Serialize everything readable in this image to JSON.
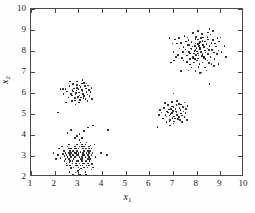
{
  "chart_data": {
    "type": "scatter",
    "title": "",
    "xlabel": "x1",
    "ylabel": "x2",
    "xlabel_base": "x",
    "xlabel_sub": "1",
    "ylabel_base": "x",
    "ylabel_sub": "2",
    "xlim": [
      1,
      10
    ],
    "ylim": [
      2,
      10
    ],
    "xticks": [
      1,
      2,
      3,
      4,
      5,
      6,
      7,
      8,
      9,
      10
    ],
    "yticks": [
      2,
      3,
      4,
      5,
      6,
      7,
      8,
      9,
      10
    ],
    "grid": false,
    "legend": null,
    "marker": "dot",
    "marker_color": "#0d0d0d",
    "marker_size": 1.6,
    "background": "#ffffff",
    "frame_color": "#4a4a4a",
    "clusters": [
      {
        "name": "cluster-lower-left",
        "center": [
          3.0,
          3.0
        ],
        "n": 120,
        "spread": [
          0.42,
          0.45
        ]
      },
      {
        "name": "cluster-mid-left",
        "center": [
          3.05,
          6.0
        ],
        "n": 55,
        "spread": [
          0.26,
          0.26
        ]
      },
      {
        "name": "cluster-center",
        "center": [
          7.05,
          5.0
        ],
        "n": 60,
        "spread": [
          0.3,
          0.27
        ]
      },
      {
        "name": "cluster-upper-right",
        "center": [
          8.05,
          7.95
        ],
        "n": 150,
        "spread": [
          0.45,
          0.42
        ]
      }
    ],
    "points": [
      [
        2.95,
        3.05
      ],
      [
        3.15,
        2.85
      ],
      [
        2.75,
        3.25
      ],
      [
        3.35,
        3.15
      ],
      [
        2.55,
        2.95
      ],
      [
        3.05,
        2.65
      ],
      [
        3.25,
        3.45
      ],
      [
        2.85,
        3.35
      ],
      [
        3.45,
        2.95
      ],
      [
        2.65,
        2.75
      ],
      [
        3.1,
        3.2
      ],
      [
        2.9,
        2.55
      ],
      [
        3.3,
        2.75
      ],
      [
        2.7,
        3.15
      ],
      [
        3.2,
        3.35
      ],
      [
        3.0,
        2.45
      ],
      [
        2.6,
        3.35
      ],
      [
        3.4,
        3.25
      ],
      [
        2.8,
        2.85
      ],
      [
        3.15,
        2.95
      ],
      [
        2.95,
        3.55
      ],
      [
        3.35,
        2.55
      ],
      [
        2.5,
        3.05
      ],
      [
        3.05,
        3.75
      ],
      [
        2.75,
        2.65
      ],
      [
        3.25,
        3.05
      ],
      [
        2.85,
        3.45
      ],
      [
        3.45,
        3.45
      ],
      [
        2.65,
        3.25
      ],
      [
        3.1,
        2.55
      ],
      [
        3.55,
        3.05
      ],
      [
        2.45,
        2.85
      ],
      [
        3.0,
        3.35
      ],
      [
        3.2,
        2.65
      ],
      [
        2.9,
        3.15
      ],
      [
        3.3,
        3.55
      ],
      [
        2.7,
        2.95
      ],
      [
        3.4,
        2.85
      ],
      [
        2.6,
        3.15
      ],
      [
        3.05,
        2.95
      ],
      [
        2.8,
        3.25
      ],
      [
        3.15,
        3.45
      ],
      [
        2.95,
        2.75
      ],
      [
        3.35,
        3.35
      ],
      [
        2.55,
        3.45
      ],
      [
        3.25,
        2.45
      ],
      [
        3.5,
        3.25
      ],
      [
        2.4,
        3.25
      ],
      [
        3.0,
        3.05
      ],
      [
        2.85,
        2.95
      ],
      [
        3.2,
        3.15
      ],
      [
        3.1,
        3.65
      ],
      [
        2.65,
        2.55
      ],
      [
        3.45,
        3.15
      ],
      [
        2.75,
        3.05
      ],
      [
        3.3,
        2.95
      ],
      [
        2.9,
        3.35
      ],
      [
        3.15,
        2.75
      ],
      [
        3.05,
        2.35
      ],
      [
        2.5,
        2.65
      ],
      [
        3.35,
        3.65
      ],
      [
        2.6,
        2.85
      ],
      [
        3.4,
        2.65
      ],
      [
        2.95,
        3.25
      ],
      [
        3.25,
        3.25
      ],
      [
        2.8,
        2.45
      ],
      [
        3.2,
        3.05
      ],
      [
        2.7,
        3.35
      ],
      [
        3.5,
        2.85
      ],
      [
        3.0,
        2.75
      ],
      [
        2.85,
        3.15
      ],
      [
        3.45,
        2.55
      ],
      [
        2.45,
        3.15
      ],
      [
        3.1,
        2.85
      ],
      [
        3.3,
        3.35
      ],
      [
        2.65,
        3.05
      ],
      [
        3.15,
        3.55
      ],
      [
        2.9,
        2.65
      ],
      [
        3.4,
        3.05
      ],
      [
        2.75,
        2.75
      ],
      [
        3.55,
        3.35
      ],
      [
        3.05,
        3.45
      ],
      [
        2.55,
        2.95
      ],
      [
        3.35,
        2.75
      ],
      [
        2.95,
        2.55
      ],
      [
        3.2,
        3.45
      ],
      [
        2.6,
        3.55
      ],
      [
        3.45,
        3.35
      ],
      [
        3.0,
        3.15
      ],
      [
        2.8,
        3.05
      ],
      [
        3.25,
        2.65
      ],
      [
        3.12,
        2.4
      ],
      [
        2.7,
        2.42
      ],
      [
        3.38,
        2.45
      ],
      [
        2.52,
        2.55
      ],
      [
        3.58,
        2.62
      ],
      [
        2.98,
        2.28
      ],
      [
        3.3,
        2.25
      ],
      [
        2.88,
        2.22
      ],
      [
        3.18,
        2.55
      ],
      [
        2.62,
        2.7
      ],
      [
        3.48,
        2.75
      ],
      [
        2.42,
        3.0
      ],
      [
        3.6,
        3.15
      ],
      [
        2.35,
        3.1
      ],
      [
        2.15,
        3.05
      ],
      [
        1.95,
        3.15
      ],
      [
        2.25,
        2.9
      ],
      [
        3.62,
        2.45
      ],
      [
        3.52,
        3.5
      ],
      [
        2.3,
        3.45
      ],
      [
        3.05,
        4.05
      ],
      [
        2.55,
        4.1
      ],
      [
        3.25,
        4.2
      ],
      [
        2.95,
        3.95
      ],
      [
        3.42,
        4.35
      ],
      [
        2.68,
        4.25
      ],
      [
        3.68,
        3.55
      ],
      [
        3.72,
        2.95
      ],
      [
        4.2,
        3.05
      ],
      [
        3.95,
        3.15
      ],
      [
        2.05,
        2.85
      ],
      [
        2.18,
        3.35
      ],
      [
        3.55,
        2.35
      ],
      [
        2.78,
        2.12
      ],
      [
        3.08,
        2.1
      ],
      [
        3.32,
        2.12
      ],
      [
        2.62,
        2.25
      ],
      [
        2.42,
        2.75
      ],
      [
        3.15,
        3.85
      ],
      [
        2.85,
        3.85
      ],
      [
        4.25,
        4.25
      ],
      [
        3.62,
        4.45
      ],
      [
        3.02,
        6.02
      ],
      [
        3.15,
        6.15
      ],
      [
        2.88,
        5.92
      ],
      [
        3.25,
        5.85
      ],
      [
        2.95,
        6.25
      ],
      [
        3.12,
        5.78
      ],
      [
        2.78,
        6.08
      ],
      [
        3.32,
        6.22
      ],
      [
        2.85,
        5.75
      ],
      [
        3.05,
        6.35
      ],
      [
        3.2,
        5.95
      ],
      [
        2.92,
        6.12
      ],
      [
        3.35,
        6.05
      ],
      [
        2.72,
        5.88
      ],
      [
        3.08,
        5.68
      ],
      [
        3.28,
        6.32
      ],
      [
        2.98,
        5.82
      ],
      [
        3.18,
        6.08
      ],
      [
        2.82,
        6.22
      ],
      [
        3.38,
        5.92
      ],
      [
        3.0,
        6.18
      ],
      [
        2.9,
        6.0
      ],
      [
        3.22,
        5.75
      ],
      [
        3.1,
        6.28
      ],
      [
        2.75,
        6.15
      ],
      [
        3.45,
        6.15
      ],
      [
        2.68,
        5.95
      ],
      [
        3.3,
        5.72
      ],
      [
        3.05,
        5.88
      ],
      [
        2.95,
        6.38
      ],
      [
        3.15,
        6.45
      ],
      [
        2.85,
        5.65
      ],
      [
        3.42,
        6.35
      ],
      [
        2.62,
        6.32
      ],
      [
        3.48,
        5.85
      ],
      [
        2.58,
        5.78
      ],
      [
        3.35,
        6.45
      ],
      [
        3.25,
        6.48
      ],
      [
        2.78,
        6.42
      ],
      [
        3.52,
        6.05
      ],
      [
        2.52,
        6.08
      ],
      [
        3.02,
        5.55
      ],
      [
        2.72,
        5.62
      ],
      [
        3.38,
        5.62
      ],
      [
        2.45,
        6.18
      ],
      [
        3.55,
        6.25
      ],
      [
        2.38,
        5.95
      ],
      [
        2.25,
        6.18
      ],
      [
        2.15,
        5.08
      ],
      [
        2.35,
        6.18
      ],
      [
        2.95,
        6.55
      ],
      [
        3.18,
        6.62
      ],
      [
        2.65,
        6.55
      ],
      [
        2.48,
        5.55
      ],
      [
        3.58,
        5.72
      ],
      [
        2.88,
        5.45
      ],
      [
        6.98,
        5.02
      ],
      [
        7.12,
        5.12
      ],
      [
        6.85,
        4.92
      ],
      [
        7.25,
        4.85
      ],
      [
        6.92,
        5.25
      ],
      [
        7.08,
        4.78
      ],
      [
        6.78,
        5.08
      ],
      [
        7.32,
        5.18
      ],
      [
        6.88,
        4.72
      ],
      [
        7.02,
        5.32
      ],
      [
        7.18,
        4.95
      ],
      [
        6.95,
        5.05
      ],
      [
        7.35,
        5.02
      ],
      [
        6.72,
        4.88
      ],
      [
        7.05,
        4.65
      ],
      [
        7.28,
        5.28
      ],
      [
        6.98,
        4.82
      ],
      [
        7.15,
        5.08
      ],
      [
        6.82,
        5.22
      ],
      [
        7.38,
        4.92
      ],
      [
        7.0,
        5.15
      ],
      [
        6.9,
        5.0
      ],
      [
        7.22,
        4.75
      ],
      [
        7.1,
        5.25
      ],
      [
        6.75,
        5.12
      ],
      [
        7.45,
        5.12
      ],
      [
        6.68,
        4.95
      ],
      [
        7.3,
        4.72
      ],
      [
        7.05,
        4.88
      ],
      [
        6.95,
        5.35
      ],
      [
        7.15,
        5.42
      ],
      [
        6.85,
        4.65
      ],
      [
        7.42,
        5.32
      ],
      [
        6.62,
        5.28
      ],
      [
        7.48,
        4.85
      ],
      [
        6.58,
        4.78
      ],
      [
        7.35,
        5.45
      ],
      [
        7.25,
        5.48
      ],
      [
        6.78,
        5.42
      ],
      [
        7.52,
        5.05
      ],
      [
        6.52,
        5.08
      ],
      [
        7.02,
        4.55
      ],
      [
        6.72,
        4.62
      ],
      [
        7.38,
        4.62
      ],
      [
        6.45,
        5.18
      ],
      [
        7.55,
        5.25
      ],
      [
        6.42,
        4.95
      ],
      [
        7.48,
        5.55
      ],
      [
        6.95,
        5.58
      ],
      [
        7.18,
        5.62
      ],
      [
        6.65,
        5.52
      ],
      [
        7.58,
        4.72
      ],
      [
        6.35,
        4.38
      ],
      [
        7.02,
        5.98
      ],
      [
        7.62,
        5.38
      ],
      [
        6.88,
        4.45
      ],
      [
        8.02,
        7.98
      ],
      [
        8.15,
        8.15
      ],
      [
        7.88,
        7.88
      ],
      [
        8.25,
        7.85
      ],
      [
        7.92,
        8.25
      ],
      [
        8.08,
        7.78
      ],
      [
        7.78,
        8.08
      ],
      [
        8.32,
        8.18
      ],
      [
        7.85,
        7.72
      ],
      [
        8.05,
        8.32
      ],
      [
        8.18,
        7.95
      ],
      [
        7.95,
        8.05
      ],
      [
        8.35,
        8.02
      ],
      [
        7.72,
        7.88
      ],
      [
        8.05,
        7.65
      ],
      [
        8.28,
        8.28
      ],
      [
        7.98,
        7.82
      ],
      [
        8.15,
        8.08
      ],
      [
        7.82,
        8.22
      ],
      [
        8.38,
        7.92
      ],
      [
        8.0,
        8.15
      ],
      [
        7.9,
        8.0
      ],
      [
        8.22,
        7.75
      ],
      [
        8.1,
        8.25
      ],
      [
        7.75,
        8.12
      ],
      [
        8.45,
        8.12
      ],
      [
        7.68,
        7.95
      ],
      [
        8.3,
        7.72
      ],
      [
        8.05,
        7.88
      ],
      [
        7.95,
        8.35
      ],
      [
        8.15,
        8.42
      ],
      [
        7.85,
        7.65
      ],
      [
        8.42,
        8.32
      ],
      [
        7.62,
        8.28
      ],
      [
        8.48,
        7.85
      ],
      [
        7.58,
        7.78
      ],
      [
        8.35,
        8.45
      ],
      [
        8.25,
        8.48
      ],
      [
        7.78,
        8.42
      ],
      [
        8.52,
        8.05
      ],
      [
        7.52,
        8.08
      ],
      [
        8.02,
        7.55
      ],
      [
        7.72,
        7.62
      ],
      [
        8.38,
        7.62
      ],
      [
        7.45,
        8.18
      ],
      [
        8.55,
        8.25
      ],
      [
        7.42,
        7.95
      ],
      [
        8.48,
        8.55
      ],
      [
        7.95,
        8.58
      ],
      [
        8.18,
        8.62
      ],
      [
        7.65,
        8.52
      ],
      [
        8.58,
        7.72
      ],
      [
        7.35,
        8.38
      ],
      [
        8.62,
        8.38
      ],
      [
        7.88,
        7.45
      ],
      [
        8.25,
        7.45
      ],
      [
        8.05,
        8.55
      ],
      [
        7.55,
        8.45
      ],
      [
        8.65,
        8.05
      ],
      [
        7.38,
        7.68
      ],
      [
        8.45,
        7.55
      ],
      [
        8.12,
        7.38
      ],
      [
        7.72,
        7.35
      ],
      [
        8.52,
        7.42
      ],
      [
        8.28,
        8.65
      ],
      [
        7.98,
        8.68
      ],
      [
        7.62,
        8.65
      ],
      [
        8.68,
        8.52
      ],
      [
        8.72,
        7.92
      ],
      [
        7.28,
        8.12
      ],
      [
        8.82,
        8.22
      ],
      [
        8.92,
        8.02
      ],
      [
        7.22,
        7.82
      ],
      [
        8.75,
        7.62
      ],
      [
        7.18,
        8.35
      ],
      [
        8.85,
        7.85
      ],
      [
        7.12,
        7.72
      ],
      [
        8.58,
        8.78
      ],
      [
        8.22,
        8.82
      ],
      [
        7.85,
        8.85
      ],
      [
        8.45,
        8.68
      ],
      [
        7.48,
        8.72
      ],
      [
        8.95,
        8.45
      ],
      [
        7.05,
        7.55
      ],
      [
        8.55,
        9.05
      ],
      [
        8.68,
        8.95
      ],
      [
        8.08,
        7.25
      ],
      [
        7.78,
        7.22
      ],
      [
        8.35,
        7.22
      ],
      [
        8.88,
        8.62
      ],
      [
        7.08,
        8.55
      ],
      [
        9.05,
        7.95
      ],
      [
        9.18,
        8.25
      ],
      [
        9.25,
        7.72
      ],
      [
        8.55,
        6.42
      ],
      [
        6.98,
        8.35
      ],
      [
        6.92,
        7.45
      ],
      [
        8.15,
        6.95
      ],
      [
        7.65,
        7.08
      ],
      [
        8.42,
        7.08
      ],
      [
        7.95,
        7.05
      ],
      [
        8.72,
        7.28
      ],
      [
        7.35,
        7.05
      ],
      [
        8.62,
        7.38
      ],
      [
        8.05,
        8.95
      ],
      [
        7.45,
        7.55
      ],
      [
        8.92,
        7.38
      ],
      [
        7.25,
        8.62
      ],
      [
        8.78,
        8.35
      ],
      [
        8.12,
        8.38
      ],
      [
        7.68,
        8.28
      ],
      [
        8.32,
        7.68
      ],
      [
        7.92,
        7.62
      ],
      [
        8.48,
        8.88
      ],
      [
        7.58,
        7.48
      ],
      [
        9.0,
        8.65
      ],
      [
        8.2,
        6.98
      ],
      [
        7.02,
        7.95
      ],
      [
        6.85,
        8.62
      ]
    ]
  },
  "axes": {
    "x_tick_labels": [
      "1",
      "2",
      "3",
      "4",
      "5",
      "6",
      "7",
      "8",
      "9",
      "10"
    ],
    "y_tick_labels": [
      "2",
      "3",
      "4",
      "5",
      "6",
      "7",
      "8",
      "9",
      "10"
    ]
  }
}
